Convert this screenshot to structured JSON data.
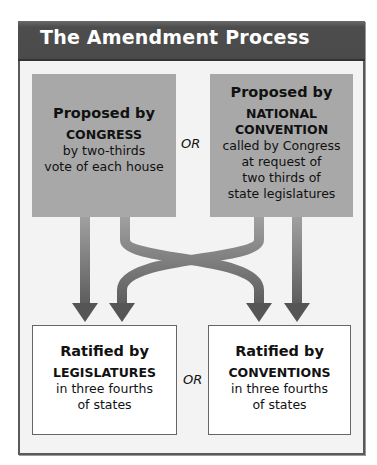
{
  "title": "The Amendment Process",
  "proposal": {
    "left": {
      "heading": "Proposed by",
      "body": "CONGRESS",
      "detail": [
        "by two-thirds",
        "vote of each house"
      ]
    },
    "connector": "OR",
    "right": {
      "heading": "Proposed by",
      "body": [
        "NATIONAL",
        "CONVENTION"
      ],
      "detail": [
        "called by Congress",
        "at request of",
        "two thirds of",
        "state legislatures"
      ]
    }
  },
  "ratification": {
    "left": {
      "heading": "Ratified by",
      "body": "LEGISLATURES",
      "detail": [
        "in three fourths",
        "of states"
      ]
    },
    "connector": "OR",
    "right": {
      "heading": "Ratified by",
      "body": "CONVENTIONS",
      "detail": [
        "in three fourths",
        "of states"
      ]
    }
  },
  "flows": [
    {
      "from": "CONGRESS",
      "to": "LEGISLATURES"
    },
    {
      "from": "CONGRESS",
      "to": "CONVENTIONS"
    },
    {
      "from": "NATIONAL CONVENTION",
      "to": "LEGISLATURES"
    },
    {
      "from": "NATIONAL CONVENTION",
      "to": "CONVENTIONS"
    }
  ],
  "colors": {
    "header_bg": "#4a4a4a",
    "proposal_box": "#a8a8a8",
    "ratification_box": "#ffffff",
    "frame_bg": "#f3f3f3",
    "arrow_top": "#a0a0a0",
    "arrow_bottom": "#4f4f4f"
  }
}
